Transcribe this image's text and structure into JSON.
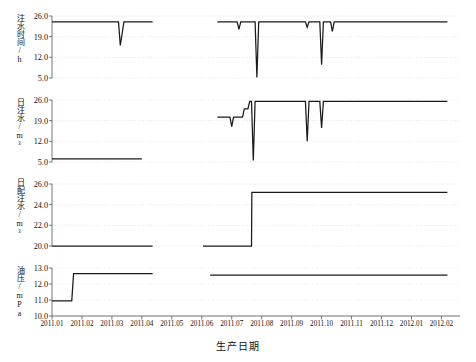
{
  "figure": {
    "width": 476,
    "height": 362,
    "background": "#ffffff",
    "line_color": "#1a1a1a",
    "grid_color": "#d9d9d9",
    "axis_color": "#555555"
  },
  "xlabel": "生产日期",
  "x_ticks": [
    "2011.01",
    "2011.02",
    "2011.03",
    "2011.04",
    "2011.05",
    "2011.06",
    "2011.07",
    "2011.08",
    "2011.09",
    "2011.10",
    "2011.11",
    "2011.12",
    "2012.01",
    "2012.02"
  ],
  "chart_data": [
    {
      "type": "line",
      "title": "",
      "xlabel": "生产日期",
      "ylabel": "注水时间/h",
      "ylim": [
        5.0,
        26.0
      ],
      "yticks": [
        5.0,
        12.0,
        19.0,
        26.0
      ],
      "ytick_labels": [
        "5.0",
        "12.0",
        "19.0",
        "26.0"
      ],
      "grid": true,
      "legend": "none",
      "x_categories": [
        "2011.01",
        "2011.02",
        "2011.03",
        "2011.04",
        "2011.05",
        "2011.06",
        "2011.07",
        "2011.08",
        "2011.09",
        "2011.10",
        "2011.11",
        "2011.12",
        "2012.01",
        "2012.02"
      ],
      "series": [
        {
          "name": "注水时间",
          "segments": [
            {
              "x": [
                2011.0,
                2011.17,
                2011.185,
                2011.19,
                2011.2,
                2011.205,
                2011.28
              ],
              "y": [
                24.0,
                24.0,
                24.0,
                16.0,
                24.0,
                24.0,
                24.0
              ]
            },
            {
              "x": [
                2011.46,
                2011.51,
                2011.515,
                2011.52,
                2011.525,
                2011.56,
                2011.565,
                2011.57,
                2011.575,
                2011.7,
                2011.705,
                2011.71,
                2011.715,
                2011.745,
                2011.75,
                2011.755,
                2011.77,
                2011.775,
                2011.78,
                2011.785,
                2012.1
              ],
              "y": [
                24.0,
                24.0,
                24.0,
                21.5,
                24.0,
                24.0,
                24.0,
                5.2,
                24.0,
                24.0,
                24.0,
                22.2,
                24.0,
                24.0,
                9.5,
                24.0,
                24.0,
                24.0,
                20.8,
                24.0,
                24.0
              ]
            }
          ]
        }
      ]
    },
    {
      "type": "line",
      "title": "",
      "xlabel": "生产日期",
      "ylabel": "日注水/m³",
      "ylim": [
        5.0,
        26.0
      ],
      "yticks": [
        5.0,
        12.0,
        19.0,
        26.0
      ],
      "ytick_labels": [
        "5.0",
        "12.0",
        "19.0",
        "26.0"
      ],
      "grid": true,
      "legend": "none",
      "x_categories": [
        "2011.01",
        "2011.02",
        "2011.03",
        "2011.04",
        "2011.05",
        "2011.06",
        "2011.07",
        "2011.08",
        "2011.09",
        "2011.10",
        "2011.11",
        "2011.12",
        "2012.01",
        "2012.02"
      ],
      "series": [
        {
          "name": "日注水",
          "segments": [
            {
              "x": [
                2011.0,
                2011.25
              ],
              "y": [
                6.1,
                6.1
              ]
            },
            {
              "x": [
                2011.46,
                2011.495,
                2011.5,
                2011.505,
                2011.51,
                2011.53,
                2011.535,
                2011.545,
                2011.55,
                2011.555,
                2011.56,
                2011.565,
                2011.7,
                2011.705,
                2011.71,
                2011.715,
                2011.745,
                2011.75,
                2011.755,
                2011.9,
                2011.905,
                2012.1
              ],
              "y": [
                20.2,
                20.2,
                17.0,
                20.2,
                20.2,
                20.2,
                23.0,
                23.0,
                25.5,
                25.5,
                5.5,
                25.5,
                25.5,
                25.5,
                12.0,
                25.5,
                25.5,
                16.5,
                25.5,
                25.5,
                25.5,
                25.5
              ]
            }
          ]
        }
      ]
    },
    {
      "type": "line",
      "title": "",
      "xlabel": "生产日期",
      "ylabel": "日配注水/m³",
      "ylim": [
        20.0,
        26.0
      ],
      "yticks": [
        20.0,
        22.0,
        24.0,
        26.0
      ],
      "ytick_labels": [
        "20.0",
        "22.0",
        "24.0",
        "26.0"
      ],
      "grid": true,
      "legend": "none",
      "x_categories": [
        "2011.01",
        "2011.02",
        "2011.03",
        "2011.04",
        "2011.05",
        "2011.06",
        "2011.07",
        "2011.08",
        "2011.09",
        "2011.10",
        "2011.11",
        "2011.12",
        "2012.01",
        "2012.02"
      ],
      "series": [
        {
          "name": "日配注水",
          "segments": [
            {
              "x": [
                2011.0,
                2011.28
              ],
              "y": [
                20.0,
                20.0
              ]
            },
            {
              "x": [
                2011.42,
                2011.555,
                2011.556,
                2012.1
              ],
              "y": [
                20.0,
                20.0,
                25.2,
                25.2
              ]
            }
          ]
        }
      ]
    },
    {
      "type": "line",
      "title": "",
      "xlabel": "生产日期",
      "ylabel": "油压/mPa",
      "ylim": [
        10.0,
        13.0
      ],
      "yticks": [
        10.0,
        11.0,
        12.0,
        13.0
      ],
      "ytick_labels": [
        "10.0",
        "11.0",
        "12.0",
        "13.0"
      ],
      "grid": true,
      "legend": "none",
      "x_categories": [
        "2011.01",
        "2011.02",
        "2011.03",
        "2011.04",
        "2011.05",
        "2011.06",
        "2011.07",
        "2011.08",
        "2011.09",
        "2011.10",
        "2011.11",
        "2011.12",
        "2012.01",
        "2012.02"
      ],
      "series": [
        {
          "name": "油压",
          "segments": [
            {
              "x": [
                2011.0,
                2011.055,
                2011.06,
                2011.28
              ],
              "y": [
                10.95,
                10.95,
                12.65,
                12.65
              ]
            },
            {
              "x": [
                2011.44,
                2012.1
              ],
              "y": [
                12.55,
                12.55
              ]
            }
          ]
        }
      ]
    }
  ]
}
